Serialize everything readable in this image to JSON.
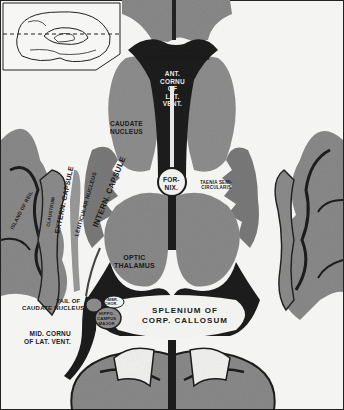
{
  "figure": {
    "colors": {
      "background": "#f4f4f2",
      "gray_matter": "#8c8c8c",
      "dark_gray_matter": "#6e6e6e",
      "ventricle": "#1c1c1c",
      "white_matter": "#f2f2f0",
      "outline": "#222222"
    },
    "inset": {
      "name": "Medial view of hemisphere with section plane indicated",
      "plane": "dashed horizontal line"
    },
    "labels": {
      "genu": [
        "GENU OF",
        "CORP. CALLOSUM"
      ],
      "ant_cornu": [
        "ANT.",
        "CORNU",
        "OF",
        "LAT.",
        "VENT."
      ],
      "caudate": [
        "CAUDATE",
        "NUCLEUS"
      ],
      "fornix": [
        "FOR-",
        "NIX."
      ],
      "taenia": [
        "TAENIA SEMI-",
        "CIRCULARIS"
      ],
      "intern_capsule": "INTERN. CAPSULE",
      "extern_capsule": "EXTERN. CAPSULE",
      "claustrum": "CLAUSTRUM",
      "lenticular": "LENTICULAR NUCLEUS",
      "island": "ISLAND OF REIL",
      "thalamus": [
        "OPTIC",
        "THALAMUS"
      ],
      "tail_caudate": [
        "TAIL OF",
        "CAUDATE NUCLEUS"
      ],
      "fimbria": [
        "FIMBR.",
        "CHOR."
      ],
      "hippocampus": [
        "HIPPO-",
        "CAMPUS",
        "MAJOR"
      ],
      "splenium": [
        "SPLENIUM OF",
        "CORP. CALLOSUM"
      ],
      "mid_cornu": [
        "MID. CORNU",
        "OF LAT. VENT."
      ]
    }
  }
}
